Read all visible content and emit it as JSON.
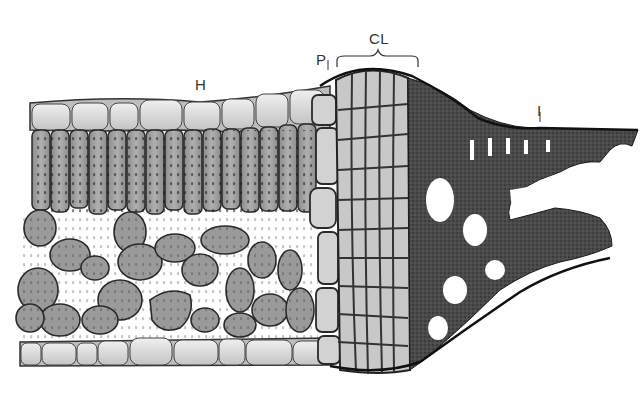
{
  "diagram": {
    "labels": {
      "H": {
        "text": "H",
        "x": 195,
        "y": 76
      },
      "P": {
        "text": "P",
        "x": 316,
        "y": 51
      },
      "CL": {
        "text": "CL",
        "x": 369,
        "y": 33
      },
      "I": {
        "text": "I",
        "x": 537,
        "y": 104
      }
    },
    "colors": {
      "background": "#ffffff",
      "epidermis_fill": "#d9d9d9",
      "mesophyll_fill": "#9a9a9a",
      "cell_outline": "#2a2a2a",
      "collenchyma_fill": "#c8c8c8",
      "dark_tissue": "#3c3c3c",
      "label_color": "#333333"
    }
  }
}
